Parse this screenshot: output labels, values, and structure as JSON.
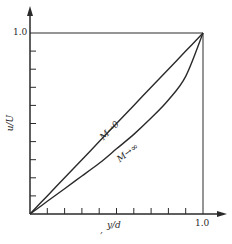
{
  "chart_data": {
    "type": "line",
    "title": "",
    "xlabel": "y/d",
    "ylabel": "u/U",
    "xlim": [
      0,
      1.0
    ],
    "ylim": [
      0,
      1.0
    ],
    "grid": false,
    "legend": "none (curves labeled inline)",
    "x_ticks": {
      "count_intervals": 10,
      "labeled": [
        "1.0"
      ]
    },
    "y_ticks": {
      "count_intervals": 10,
      "labeled": [
        "1.0"
      ]
    },
    "x": [
      0.0,
      0.1,
      0.2,
      0.3,
      0.4,
      0.5,
      0.6,
      0.7,
      0.8,
      0.9,
      1.0
    ],
    "series": [
      {
        "name": "M→0",
        "values": [
          0.0,
          0.1,
          0.2,
          0.3,
          0.4,
          0.5,
          0.6,
          0.7,
          0.8,
          0.9,
          1.0
        ]
      },
      {
        "name": "M→∞",
        "values": [
          0.0,
          0.07,
          0.14,
          0.21,
          0.28,
          0.36,
          0.44,
          0.53,
          0.63,
          0.76,
          1.0
        ]
      }
    ],
    "annotations": [
      {
        "text": "M→0",
        "position": "along upper curve, mid-plot"
      },
      {
        "text": "M→∞",
        "position": "along lower curve, mid-plot"
      }
    ],
    "frame": "box lines at u/U = 1.0 and y/d = 1.0"
  },
  "labels": {
    "y_tick_top": "1.0",
    "x_tick_right": "1.0",
    "y_axis": "u/U",
    "x_axis": "y/d",
    "x_axis_prefix": ",",
    "curve_upper": "M→0",
    "curve_lower": "M→∞"
  },
  "colors": {
    "line": "#2a2a2a",
    "background": "#ffffff"
  }
}
